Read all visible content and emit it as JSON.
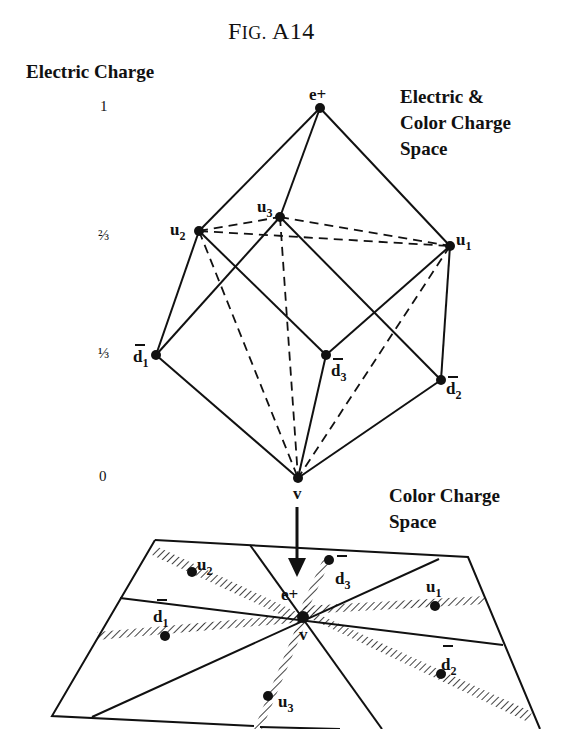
{
  "figure": {
    "title_prefix": "F",
    "title_smallcaps": "IG.",
    "title_suffix": " A14"
  },
  "axis": {
    "title": "Electric Charge",
    "ticks": [
      {
        "label": "1",
        "y": 108
      },
      {
        "label": "⅔",
        "y": 237
      },
      {
        "label": "⅓",
        "y": 355
      },
      {
        "label": "0",
        "y": 478
      }
    ]
  },
  "top_diagram": {
    "caption_lines": [
      "Electric &",
      "Color  Charge",
      "Space"
    ],
    "nodes": [
      {
        "id": "e+",
        "base": "e+",
        "sub": "",
        "bar": false,
        "electric_charge": "1"
      },
      {
        "id": "u1",
        "base": "u",
        "sub": "1",
        "bar": false,
        "electric_charge": "2/3"
      },
      {
        "id": "u2",
        "base": "u",
        "sub": "2",
        "bar": false,
        "electric_charge": "2/3"
      },
      {
        "id": "u3",
        "base": "u",
        "sub": "3",
        "bar": false,
        "electric_charge": "2/3"
      },
      {
        "id": "d1bar",
        "base": "d",
        "sub": "1",
        "bar": true,
        "electric_charge": "1/3"
      },
      {
        "id": "d2bar",
        "base": "d",
        "sub": "2",
        "bar": true,
        "electric_charge": "1/3"
      },
      {
        "id": "d3bar",
        "base": "d",
        "sub": "3",
        "bar": true,
        "electric_charge": "1/3"
      },
      {
        "id": "v",
        "base": "v",
        "sub": "",
        "bar": false,
        "electric_charge": "0"
      }
    ]
  },
  "bottom_diagram": {
    "caption_lines": [
      "Color  Charge",
      "Space"
    ],
    "center_labels": {
      "top": "e+",
      "bottom": "v"
    },
    "nodes": [
      {
        "id": "u1",
        "base": "u",
        "sub": "1"
      },
      {
        "id": "u2",
        "base": "u",
        "sub": "2"
      },
      {
        "id": "u3",
        "base": "u",
        "sub": "3"
      },
      {
        "id": "d1bar",
        "base": "d",
        "sub": "1"
      },
      {
        "id": "d2bar",
        "base": "d",
        "sub": "2"
      },
      {
        "id": "d3bar",
        "base": "d",
        "sub": "3"
      }
    ]
  },
  "labels": {
    "e_plus": "e+",
    "u": "u",
    "d": "d",
    "v": "v",
    "s1": "1",
    "s2": "2",
    "s3": "3"
  }
}
